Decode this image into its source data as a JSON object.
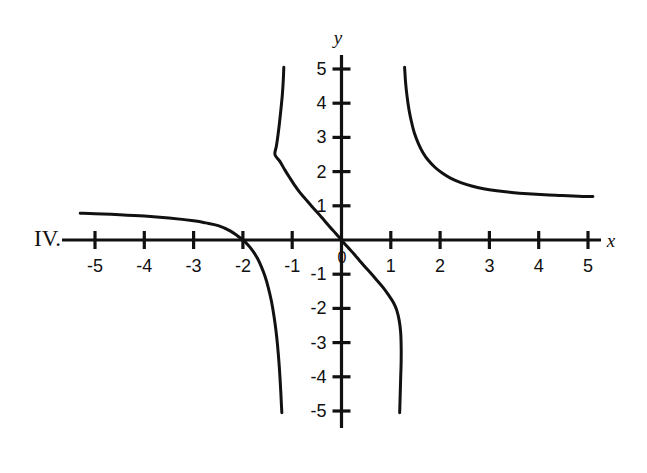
{
  "figure": {
    "item_label": "IV.",
    "background_color": "#ffffff",
    "ink_color": "#111111"
  },
  "axes": {
    "x_axis_name": "x",
    "y_axis_name": "y",
    "origin_label": "0",
    "x_tick_labels": [
      "-5",
      "-4",
      "-3",
      "-2",
      "-1",
      "1",
      "2",
      "3",
      "4",
      "5"
    ],
    "y_tick_labels": [
      "5",
      "4",
      "3",
      "2",
      "1",
      "-1",
      "-2",
      "-3",
      "-4",
      "-5"
    ]
  },
  "chart_data": {
    "type": "line",
    "title": "",
    "subtitle": "",
    "xlabel": "x",
    "ylabel": "y",
    "xlim": [
      -5.6,
      5.4
    ],
    "ylim": [
      -5.4,
      5.4
    ],
    "grid": false,
    "legend": "none",
    "xticks": [
      -5,
      -4,
      -3,
      -2,
      -1,
      1,
      2,
      3,
      4,
      5
    ],
    "yticks": [
      5,
      4,
      3,
      2,
      1,
      -1,
      -2,
      -3,
      -4,
      -5
    ],
    "annotations": [
      "IV."
    ],
    "series": [
      {
        "name": "left-branch",
        "comment": "Quadrant II branch: starts near (-5.3, 0.78), decreases slowly, crosses x-axis at x = -2, then plunges to -5 approaching vertical asymptote x = -1.2",
        "points": [
          [
            -5.3,
            0.78
          ],
          [
            -5.0,
            0.77
          ],
          [
            -4.5,
            0.74
          ],
          [
            -4.0,
            0.7
          ],
          [
            -3.5,
            0.64
          ],
          [
            -3.0,
            0.56
          ],
          [
            -2.75,
            0.5
          ],
          [
            -2.5,
            0.42
          ],
          [
            -2.25,
            0.26
          ],
          [
            -2.0,
            0.0
          ],
          [
            -1.9,
            -0.14
          ],
          [
            -1.8,
            -0.32
          ],
          [
            -1.7,
            -0.55
          ],
          [
            -1.62,
            -0.8
          ],
          [
            -1.55,
            -1.07
          ],
          [
            -1.48,
            -1.42
          ],
          [
            -1.42,
            -1.8
          ],
          [
            -1.37,
            -2.22
          ],
          [
            -1.33,
            -2.64
          ],
          [
            -1.3,
            -3.04
          ],
          [
            -1.27,
            -3.55
          ],
          [
            -1.25,
            -3.97
          ],
          [
            -1.23,
            -4.48
          ],
          [
            -1.22,
            -4.78
          ],
          [
            -1.21,
            -5.05
          ]
        ]
      },
      {
        "name": "middle-branch",
        "comment": "Central branch through the origin: descends from (-1.17, 5.0) through (0,0) down to (1.17, -5.0)",
        "points": [
          [
            -1.17,
            5.05
          ],
          [
            -1.18,
            4.7
          ],
          [
            -1.2,
            4.25
          ],
          [
            -1.23,
            3.8
          ],
          [
            -1.26,
            3.4
          ],
          [
            -1.29,
            3.05
          ],
          [
            -1.32,
            2.75
          ],
          [
            -1.35,
            2.5
          ],
          [
            -1.25,
            2.3
          ],
          [
            -1.15,
            2.05
          ],
          [
            -1.05,
            1.82
          ],
          [
            -0.95,
            1.6
          ],
          [
            -0.85,
            1.4
          ],
          [
            -0.72,
            1.18
          ],
          [
            -0.6,
            0.98
          ],
          [
            -0.48,
            0.79
          ],
          [
            -0.36,
            0.59
          ],
          [
            -0.24,
            0.39
          ],
          [
            -0.12,
            0.2
          ],
          [
            0.0,
            0.0
          ],
          [
            0.12,
            -0.2
          ],
          [
            0.24,
            -0.39
          ],
          [
            0.36,
            -0.59
          ],
          [
            0.48,
            -0.79
          ],
          [
            0.6,
            -0.98
          ],
          [
            0.72,
            -1.18
          ],
          [
            0.85,
            -1.4
          ],
          [
            0.95,
            -1.6
          ],
          [
            1.05,
            -1.82
          ],
          [
            1.12,
            -2.05
          ],
          [
            1.17,
            -2.35
          ],
          [
            1.2,
            -2.7
          ],
          [
            1.21,
            -3.1
          ],
          [
            1.21,
            -3.55
          ],
          [
            1.2,
            -4.05
          ],
          [
            1.19,
            -4.55
          ],
          [
            1.18,
            -5.05
          ]
        ]
      },
      {
        "name": "right-branch",
        "comment": "Quadrant I branch: drops steeply from (1.28, 5.0), flattens toward horizontal asymptote y ≈ 1.27 by x = 5.1",
        "points": [
          [
            1.28,
            5.05
          ],
          [
            1.3,
            4.6
          ],
          [
            1.33,
            4.2
          ],
          [
            1.37,
            3.8
          ],
          [
            1.42,
            3.45
          ],
          [
            1.48,
            3.12
          ],
          [
            1.56,
            2.82
          ],
          [
            1.65,
            2.56
          ],
          [
            1.76,
            2.33
          ],
          [
            1.9,
            2.12
          ],
          [
            2.05,
            1.95
          ],
          [
            2.22,
            1.8
          ],
          [
            2.42,
            1.68
          ],
          [
            2.64,
            1.58
          ],
          [
            2.88,
            1.5
          ],
          [
            3.15,
            1.44
          ],
          [
            3.45,
            1.39
          ],
          [
            3.78,
            1.35
          ],
          [
            4.12,
            1.32
          ],
          [
            4.48,
            1.3
          ],
          [
            4.8,
            1.28
          ],
          [
            5.1,
            1.27
          ]
        ]
      }
    ]
  }
}
